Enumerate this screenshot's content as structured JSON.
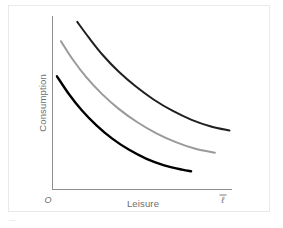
{
  "figure": {
    "name": "indifference-curves-consumption-leisure",
    "background_color": "#ffffff",
    "frame_color": "#e9e9e9"
  },
  "axes": {
    "x_title": "Leisure",
    "y_title": "Consumption",
    "origin_label": "O",
    "x_endpoint_label": "ℓ",
    "x_endpoint_has_overbar": true,
    "axis_color": "#8d8d8d",
    "label_color": "#6d6d6d"
  },
  "chart_data": {
    "type": "line",
    "title": "",
    "subtitle": "",
    "xlabel": "Leisure",
    "ylabel": "Consumption",
    "xlim": [
      0,
      1
    ],
    "ylim": [
      0,
      1
    ],
    "grid": false,
    "legend": "none",
    "annotations": [
      {
        "text": "O",
        "role": "origin-label",
        "x": 0,
        "y": 0
      },
      {
        "text": "ℓ̄",
        "role": "x-axis-endpoint-label",
        "x": 1,
        "y": 0
      }
    ],
    "series": [
      {
        "name": "Indifference curve U3 (highest)",
        "color": "#1f1f1f",
        "width": 2.0,
        "x": [
          0.138,
          0.205,
          0.281,
          0.368,
          0.463,
          0.563,
          0.668,
          0.775,
          0.883,
          0.986
        ],
        "y": [
          0.955,
          0.862,
          0.765,
          0.672,
          0.588,
          0.513,
          0.449,
          0.397,
          0.359,
          0.336
        ]
      },
      {
        "name": "Indifference curve U2 (middle)",
        "color": "#9a9a9a",
        "width": 2.0,
        "x": [
          0.047,
          0.112,
          0.188,
          0.275,
          0.371,
          0.473,
          0.579,
          0.687,
          0.796,
          0.905
        ],
        "y": [
          0.845,
          0.742,
          0.64,
          0.545,
          0.458,
          0.383,
          0.32,
          0.27,
          0.232,
          0.21
        ]
      },
      {
        "name": "Indifference curve U1 (lowest)",
        "color": "#000000",
        "width": 2.4,
        "x": [
          0.025,
          0.09,
          0.163,
          0.245,
          0.333,
          0.427,
          0.524,
          0.622,
          0.722,
          0.772
        ],
        "y": [
          0.645,
          0.546,
          0.452,
          0.366,
          0.29,
          0.226,
          0.175,
          0.138,
          0.113,
          0.104
        ]
      }
    ]
  }
}
